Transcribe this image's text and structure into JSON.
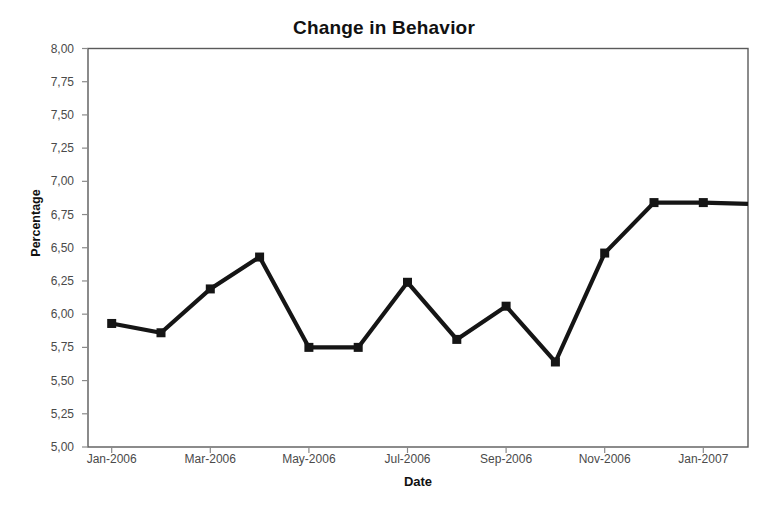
{
  "chart_data": {
    "type": "line",
    "title": "Change in Behavior",
    "xlabel": "Date",
    "ylabel": "Percentage",
    "grid": false,
    "legend": "none",
    "marker": "square",
    "line_color": "#151515",
    "x": [
      "Jan-2006",
      "Feb-2006",
      "Mar-2006",
      "Apr-2006",
      "May-2006",
      "Jun-2006",
      "Jul-2006",
      "Aug-2006",
      "Sep-2006",
      "Oct-2006",
      "Nov-2006",
      "Dec-2006",
      "Jan-2007",
      "Feb-2007"
    ],
    "values": [
      5.93,
      5.86,
      6.19,
      6.43,
      5.75,
      5.75,
      6.24,
      5.81,
      6.06,
      5.64,
      6.46,
      6.84,
      6.84,
      6.83
    ],
    "series": [
      {
        "name": "Percentage",
        "values": [
          5.93,
          5.86,
          6.19,
          6.43,
          5.75,
          5.75,
          6.24,
          5.81,
          6.06,
          5.64,
          6.46,
          6.84,
          6.84,
          6.83
        ]
      }
    ],
    "ylim": [
      5.0,
      8.0
    ],
    "ytick_step": 0.25,
    "ytick_labels": [
      "8,00",
      "7,75",
      "7,50",
      "7,25",
      "7,00",
      "6,75",
      "6,50",
      "6,25",
      "6,00",
      "5,75",
      "5,50",
      "5,25",
      "5,00"
    ],
    "ytick_values": [
      8.0,
      7.75,
      7.5,
      7.25,
      7.0,
      6.75,
      6.5,
      6.25,
      6.0,
      5.75,
      5.5,
      5.25,
      5.0
    ],
    "xtick_labels": [
      "Jan-2006",
      "Mar-2006",
      "May-2006",
      "Jul-2006",
      "Sep-2006",
      "Nov-2006",
      "Jan-2007"
    ],
    "xtick_positions": [
      0,
      2,
      4,
      6,
      8,
      10,
      12
    ],
    "decimal_separator": ","
  }
}
